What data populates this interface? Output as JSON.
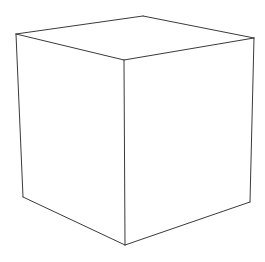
{
  "figure": {
    "style": "line-drawing",
    "background": "#ffffff",
    "stroke_color": "#3a3a3a",
    "vertices": {
      "top_back": [
        143,
        16
      ],
      "top_left": [
        16,
        34
      ],
      "top_right": [
        254,
        38
      ],
      "top_front": [
        124,
        60
      ],
      "bottom_left": [
        23,
        197
      ],
      "bottom_right": [
        250,
        202
      ],
      "bottom_front": [
        125,
        245
      ]
    },
    "edges": [
      [
        "top_left",
        "top_back"
      ],
      [
        "top_back",
        "top_right"
      ],
      [
        "top_left",
        "top_front"
      ],
      [
        "top_front",
        "top_right"
      ],
      [
        "top_left",
        "bottom_left"
      ],
      [
        "top_front",
        "bottom_front"
      ],
      [
        "top_right",
        "bottom_right"
      ],
      [
        "bottom_left",
        "bottom_front"
      ],
      [
        "bottom_front",
        "bottom_right"
      ]
    ]
  }
}
